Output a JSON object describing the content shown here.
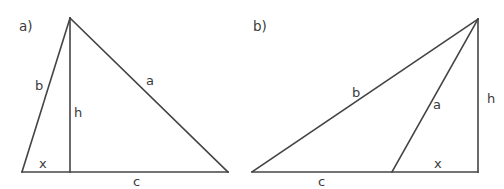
{
  "figure": {
    "kind": "geometry-diagram",
    "width": 504,
    "height": 189,
    "background_color": "#ffffff",
    "stroke_color": "#444444",
    "text_color": "#3a3a3a"
  },
  "panels": [
    {
      "tag": "a)",
      "tag_pos": {
        "x": 19,
        "y": 20
      },
      "triangle": {
        "apex": {
          "x": 70,
          "y": 18
        },
        "base_left": {
          "x": 22,
          "y": 172
        },
        "base_right": {
          "x": 228,
          "y": 172
        },
        "foot_of_height": {
          "x": 70,
          "y": 172
        },
        "height_inside": true
      },
      "labels": [
        {
          "text": "b",
          "name": "side-b-label",
          "x": 35,
          "y": 79
        },
        {
          "text": "h",
          "name": "height-h-label",
          "x": 74,
          "y": 106
        },
        {
          "text": "a",
          "name": "side-a-label",
          "x": 146,
          "y": 74
        },
        {
          "text": "x",
          "name": "angle-x-label",
          "x": 39,
          "y": 157
        },
        {
          "text": "c",
          "name": "base-c-label",
          "x": 133,
          "y": 175
        }
      ]
    },
    {
      "tag": "b)",
      "tag_pos": {
        "x": 253,
        "y": 20
      },
      "triangle": {
        "apex": {
          "x": 478,
          "y": 19
        },
        "base_left": {
          "x": 252,
          "y": 172
        },
        "base_right": {
          "x": 478,
          "y": 172
        },
        "foot_of_height": {
          "x": 478,
          "y": 172
        },
        "inner_point": {
          "x": 392,
          "y": 172
        },
        "height_inside": false
      },
      "labels": [
        {
          "text": "b",
          "name": "side-b-label",
          "x": 352,
          "y": 86
        },
        {
          "text": "a",
          "name": "side-a-label",
          "x": 433,
          "y": 98
        },
        {
          "text": "h",
          "name": "height-h-label",
          "x": 487,
          "y": 92
        },
        {
          "text": "x",
          "name": "angle-x-label",
          "x": 434,
          "y": 157
        },
        {
          "text": "c",
          "name": "base-c-label",
          "x": 318,
          "y": 175
        }
      ]
    }
  ]
}
